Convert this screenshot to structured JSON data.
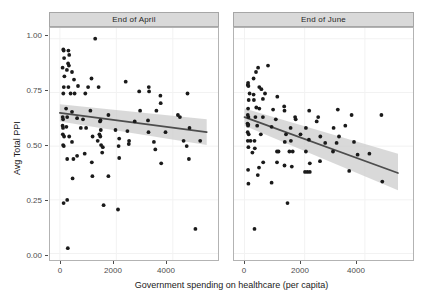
{
  "chart_data": {
    "type": "scatter",
    "title": "",
    "xlabel": "Government spending on healthcare (per capita)",
    "ylabel": "Avg Total PPI",
    "xlim": [
      -350,
      5600
    ],
    "ylim": [
      -0.03,
      1.05
    ],
    "xticks": [
      0,
      2000,
      4000
    ],
    "xticklabels": [
      "0",
      "2000",
      "4000"
    ],
    "yticks": [
      0.0,
      0.25,
      0.5,
      0.75,
      1.0
    ],
    "yticklabels": [
      "0.00",
      "0.25",
      "0.50",
      "0.75",
      "1.00"
    ],
    "grid": true,
    "legend": "none",
    "facets": [
      {
        "label": "End of April",
        "points": [
          [
            1250,
            1.0
          ],
          [
            120,
            0.95
          ],
          [
            135,
            0.945
          ],
          [
            300,
            0.945
          ],
          [
            150,
            0.91
          ],
          [
            330,
            0.925
          ],
          [
            95,
            0.865
          ],
          [
            290,
            0.885
          ],
          [
            320,
            0.875
          ],
          [
            250,
            0.855
          ],
          [
            430,
            0.845
          ],
          [
            160,
            0.825
          ],
          [
            500,
            0.81
          ],
          [
            1120,
            0.815
          ],
          [
            2330,
            0.8
          ],
          [
            140,
            0.775
          ],
          [
            300,
            0.775
          ],
          [
            640,
            0.78
          ],
          [
            1000,
            0.775
          ],
          [
            1370,
            0.775
          ],
          [
            2810,
            0.755
          ],
          [
            3150,
            0.775
          ],
          [
            3160,
            0.755
          ],
          [
            120,
            0.745
          ],
          [
            380,
            0.745
          ],
          [
            520,
            0.745
          ],
          [
            900,
            0.745
          ],
          [
            3560,
            0.735
          ],
          [
            3570,
            0.7
          ],
          [
            4520,
            0.745
          ],
          [
            220,
            0.675
          ],
          [
            430,
            0.66
          ],
          [
            1080,
            0.665
          ],
          [
            1720,
            0.645
          ],
          [
            2840,
            0.665
          ],
          [
            3420,
            0.665
          ],
          [
            4180,
            0.645
          ],
          [
            100,
            0.635
          ],
          [
            115,
            0.625
          ],
          [
            260,
            0.635
          ],
          [
            610,
            0.63
          ],
          [
            820,
            0.625
          ],
          [
            1420,
            0.615
          ],
          [
            1440,
            0.62
          ],
          [
            2650,
            0.615
          ],
          [
            3120,
            0.62
          ],
          [
            4250,
            0.635
          ],
          [
            95,
            0.595
          ],
          [
            110,
            0.585
          ],
          [
            230,
            0.59
          ],
          [
            740,
            0.585
          ],
          [
            930,
            0.585
          ],
          [
            1450,
            0.575
          ],
          [
            1970,
            0.575
          ],
          [
            2390,
            0.57
          ],
          [
            3140,
            0.565
          ],
          [
            3740,
            0.565
          ],
          [
            4590,
            0.585
          ],
          [
            105,
            0.555
          ],
          [
            150,
            0.545
          ],
          [
            330,
            0.545
          ],
          [
            1160,
            0.545
          ],
          [
            1400,
            0.555
          ],
          [
            1430,
            0.545
          ],
          [
            2100,
            0.535
          ],
          [
            2450,
            0.525
          ],
          [
            3330,
            0.52
          ],
          [
            4380,
            0.525
          ],
          [
            4970,
            0.525
          ],
          [
            115,
            0.505
          ],
          [
            140,
            0.5
          ],
          [
            430,
            0.52
          ],
          [
            1340,
            0.525
          ],
          [
            1460,
            0.505
          ],
          [
            1520,
            0.495
          ],
          [
            2080,
            0.5
          ],
          [
            2440,
            0.51
          ],
          [
            3380,
            0.485
          ],
          [
            4490,
            0.5
          ],
          [
            260,
            0.44
          ],
          [
            480,
            0.44
          ],
          [
            610,
            0.455
          ],
          [
            880,
            0.465
          ],
          [
            1130,
            0.425
          ],
          [
            1500,
            0.47
          ],
          [
            2100,
            0.445
          ],
          [
            3590,
            0.42
          ],
          [
            4570,
            0.44
          ],
          [
            450,
            0.35
          ],
          [
            1150,
            0.36
          ],
          [
            1720,
            0.36
          ],
          [
            130,
            0.235
          ],
          [
            260,
            0.25
          ],
          [
            1550,
            0.225
          ],
          [
            2060,
            0.205
          ],
          [
            4800,
            0.115
          ],
          [
            280,
            0.025
          ]
        ],
        "fit": {
          "x0": 0,
          "y0": 0.655,
          "x1": 5200,
          "y1": 0.565
        },
        "ci_upper": {
          "y0": 0.695,
          "y1": 0.625
        },
        "ci_lower": {
          "y0": 0.615,
          "y1": 0.505
        }
      },
      {
        "label": "End of June",
        "points": [
          [
            450,
            0.865
          ],
          [
            780,
            0.875
          ],
          [
            380,
            0.845
          ],
          [
            300,
            0.815
          ],
          [
            110,
            0.785
          ],
          [
            120,
            0.795
          ],
          [
            130,
            0.78
          ],
          [
            490,
            0.775
          ],
          [
            560,
            0.765
          ],
          [
            170,
            0.745
          ],
          [
            300,
            0.74
          ],
          [
            680,
            0.745
          ],
          [
            140,
            0.715
          ],
          [
            310,
            0.715
          ],
          [
            610,
            0.72
          ],
          [
            1090,
            0.73
          ],
          [
            120,
            0.675
          ],
          [
            390,
            0.68
          ],
          [
            490,
            0.675
          ],
          [
            950,
            0.67
          ],
          [
            1320,
            0.685
          ],
          [
            1330,
            0.665
          ],
          [
            2150,
            0.665
          ],
          [
            3100,
            0.67
          ],
          [
            110,
            0.645
          ],
          [
            130,
            0.635
          ],
          [
            360,
            0.635
          ],
          [
            610,
            0.635
          ],
          [
            1040,
            0.625
          ],
          [
            1680,
            0.635
          ],
          [
            1700,
            0.625
          ],
          [
            2400,
            0.615
          ],
          [
            2450,
            0.635
          ],
          [
            3560,
            0.645
          ],
          [
            4550,
            0.645
          ],
          [
            100,
            0.605
          ],
          [
            115,
            0.595
          ],
          [
            125,
            0.6
          ],
          [
            420,
            0.595
          ],
          [
            900,
            0.59
          ],
          [
            1530,
            0.585
          ],
          [
            2040,
            0.585
          ],
          [
            2960,
            0.585
          ],
          [
            3350,
            0.595
          ],
          [
            105,
            0.565
          ],
          [
            140,
            0.555
          ],
          [
            540,
            0.555
          ],
          [
            1380,
            0.555
          ],
          [
            1860,
            0.555
          ],
          [
            2520,
            0.545
          ],
          [
            3140,
            0.545
          ],
          [
            110,
            0.525
          ],
          [
            200,
            0.525
          ],
          [
            330,
            0.525
          ],
          [
            1340,
            0.52
          ],
          [
            1540,
            0.525
          ],
          [
            2140,
            0.53
          ],
          [
            2680,
            0.515
          ],
          [
            3060,
            0.515
          ],
          [
            3640,
            0.52
          ],
          [
            130,
            0.495
          ],
          [
            340,
            0.49
          ],
          [
            260,
            0.47
          ],
          [
            1080,
            0.475
          ],
          [
            1130,
            0.475
          ],
          [
            1490,
            0.475
          ],
          [
            1600,
            0.475
          ],
          [
            2040,
            0.475
          ],
          [
            2940,
            0.475
          ],
          [
            3760,
            0.46
          ],
          [
            4150,
            0.465
          ],
          [
            620,
            0.425
          ],
          [
            1080,
            0.425
          ],
          [
            480,
            0.4
          ],
          [
            1330,
            0.41
          ],
          [
            1570,
            0.405
          ],
          [
            2170,
            0.42
          ],
          [
            2510,
            0.43
          ],
          [
            120,
            0.39
          ],
          [
            440,
            0.365
          ],
          [
            2010,
            0.38
          ],
          [
            2090,
            0.38
          ],
          [
            2170,
            0.38
          ],
          [
            3480,
            0.385
          ],
          [
            130,
            0.325
          ],
          [
            900,
            0.33
          ],
          [
            4580,
            0.335
          ],
          [
            1430,
            0.235
          ],
          [
            330,
            0.115
          ]
        ],
        "fit": {
          "x0": 0,
          "y0": 0.635,
          "x1": 5100,
          "y1": 0.375
        },
        "ci_upper": {
          "y0": 0.675,
          "y1": 0.465
        },
        "ci_lower": {
          "y0": 0.595,
          "y1": 0.295
        }
      }
    ]
  },
  "style": {
    "point_color": "#1a1a1a",
    "line_color": "#4d4d4d",
    "band_color": "#cccccc",
    "strip_fill": "#d9d9d9",
    "grid_color": "#f2f2f2",
    "panel_border": "#b3b3b3"
  }
}
